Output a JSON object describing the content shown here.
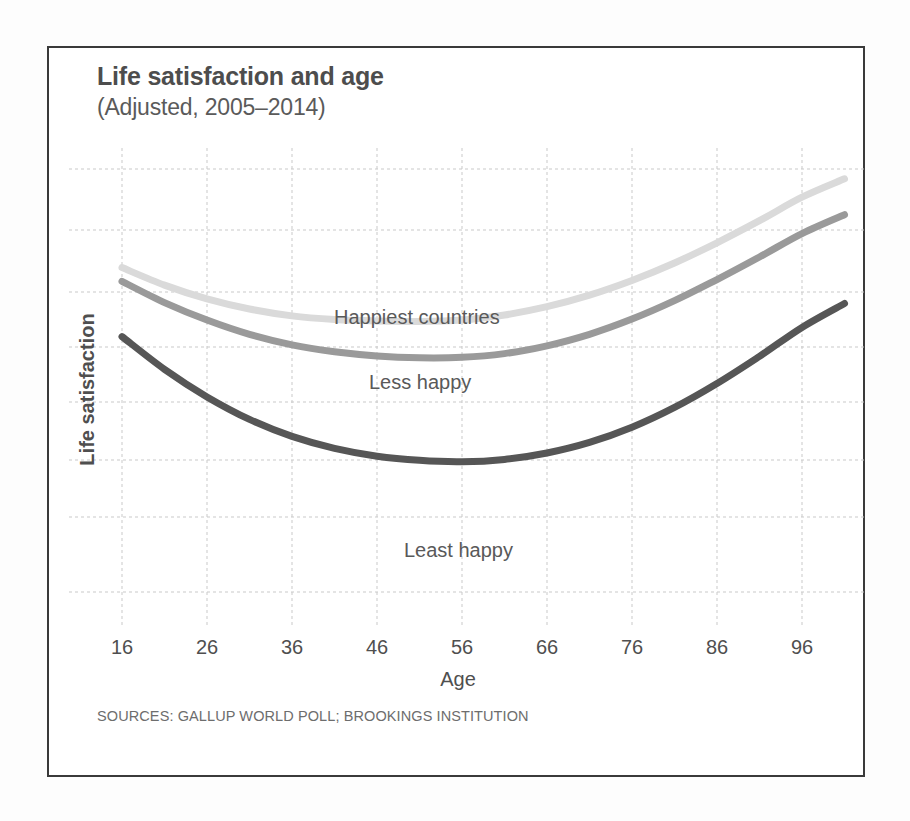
{
  "header": {
    "title": "Life satisfaction and age",
    "subtitle": "(Adjusted, 2005–2014)"
  },
  "footer": {
    "source": "SOURCES: GALLUP WORLD POLL; BROOKINGS INSTITUTION"
  },
  "axes": {
    "x_title": "Age",
    "y_title": "Life satisfaction"
  },
  "series_labels": {
    "happiest": "Happiest countries",
    "less_happy": "Less happy",
    "least_happy": "Least happy"
  },
  "colors": {
    "happiest": "#dadada",
    "less_happy": "#9a9a9a",
    "least_happy": "#565656",
    "grid": "#c9c9c9",
    "frame": "#3a3a3a",
    "title_text": "#4d4d4d",
    "body_text": "#4f4f4f",
    "source_text": "#6d6d6d"
  },
  "chart_data": {
    "type": "line",
    "title": "Life satisfaction and age",
    "subtitle": "(Adjusted, 2005–2014)",
    "xlabel": "Age",
    "ylabel": "Life satisfaction",
    "xlim": [
      16,
      103
    ],
    "ylim": [
      0,
      10
    ],
    "xticks": [
      16,
      26,
      36,
      46,
      56,
      66,
      76,
      86,
      96
    ],
    "xtick_labels": [
      "16",
      "26",
      "36",
      "46",
      "56",
      "66",
      "76",
      "86",
      "96"
    ],
    "yticks": [],
    "ytick_labels": [],
    "grid": true,
    "legend": "inline-annotations",
    "note": "Y axis is unlabeled; values below are relative life-satisfaction units read off the gridlines (higher = more satisfied).",
    "x": [
      16,
      21,
      26,
      31,
      36,
      41,
      46,
      51,
      56,
      61,
      66,
      71,
      76,
      81,
      86,
      91,
      96,
      101
    ],
    "series": [
      {
        "name": "Happiest countries",
        "color": "#dadada",
        "minimum_age": 52,
        "values": [
          7.4,
          7.02,
          6.72,
          6.5,
          6.35,
          6.27,
          6.24,
          6.23,
          6.26,
          6.37,
          6.55,
          6.8,
          7.12,
          7.5,
          7.94,
          8.42,
          8.93,
          9.33
        ]
      },
      {
        "name": "Less happy",
        "color": "#9a9a9a",
        "minimum_age": 57,
        "values": [
          7.1,
          6.64,
          6.26,
          5.95,
          5.72,
          5.57,
          5.48,
          5.44,
          5.45,
          5.53,
          5.7,
          5.95,
          6.28,
          6.68,
          7.14,
          7.63,
          8.14,
          8.55
        ]
      },
      {
        "name": "Least happy",
        "color": "#565656",
        "minimum_age": 58,
        "values": [
          5.9,
          5.19,
          4.59,
          4.1,
          3.73,
          3.47,
          3.3,
          3.21,
          3.18,
          3.23,
          3.37,
          3.6,
          3.93,
          4.36,
          4.88,
          5.47,
          6.1,
          6.62
        ]
      }
    ]
  }
}
